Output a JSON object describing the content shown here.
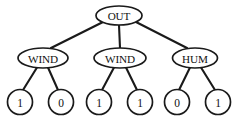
{
  "figure": {
    "kind": "decision-tree-diagram",
    "background_color": "#ffffff",
    "stroke_color": "#1a1a1a",
    "node_fill_color": "#ffffff",
    "width": 239,
    "height": 117
  },
  "tree": {
    "root": {
      "id": "root",
      "label": "OUT",
      "shape": "ellipse",
      "cx": 119,
      "cy": 15.5,
      "rx": 23,
      "ry": 9.5
    },
    "internal": [
      {
        "id": "node-wind-left",
        "label": "WIND",
        "shape": "ellipse",
        "cx": 43,
        "cy": 58,
        "rx": 25,
        "ry": 10
      },
      {
        "id": "node-wind-middle",
        "label": "WIND",
        "shape": "ellipse",
        "cx": 120,
        "cy": 58,
        "rx": 26,
        "ry": 10
      },
      {
        "id": "node-hum-right",
        "label": "HUM",
        "shape": "ellipse",
        "cx": 195,
        "cy": 58,
        "rx": 22.5,
        "ry": 10
      }
    ],
    "leaves": [
      {
        "id": "leaf-1",
        "label": "1",
        "shape": "circle",
        "cx": 20,
        "cy": 102,
        "r": 12.5,
        "parent": "node-wind-left"
      },
      {
        "id": "leaf-2",
        "label": "0",
        "shape": "circle",
        "cx": 61,
        "cy": 102,
        "r": 12.5,
        "parent": "node-wind-left"
      },
      {
        "id": "leaf-3",
        "label": "1",
        "shape": "circle",
        "cx": 99,
        "cy": 102,
        "r": 12.5,
        "parent": "node-wind-middle"
      },
      {
        "id": "leaf-4",
        "label": "1",
        "shape": "circle",
        "cx": 140,
        "cy": 102,
        "r": 12.5,
        "parent": "node-wind-middle"
      },
      {
        "id": "leaf-5",
        "label": "0",
        "shape": "circle",
        "cx": 177,
        "cy": 102,
        "r": 12.5,
        "parent": "node-hum-right"
      },
      {
        "id": "leaf-6",
        "label": "1",
        "shape": "circle",
        "cx": 218,
        "cy": 102,
        "r": 12.5,
        "parent": "node-hum-right"
      }
    ],
    "edges": [
      {
        "id": "edge-root-wind-left",
        "from": "root",
        "to": "node-wind-left",
        "x1": 103,
        "y1": 22,
        "x2": 51,
        "y2": 48
      },
      {
        "id": "edge-root-wind-middle",
        "from": "root",
        "to": "node-wind-middle",
        "x1": 119,
        "y1": 25,
        "x2": 120,
        "y2": 48
      },
      {
        "id": "edge-root-hum-right",
        "from": "root",
        "to": "node-hum-right",
        "x1": 136,
        "y1": 22,
        "x2": 187,
        "y2": 48
      },
      {
        "id": "edge-wind-left-leaf-1",
        "from": "node-wind-left",
        "to": "leaf-1",
        "x1": 37,
        "y1": 67.5,
        "x2": 23,
        "y2": 90
      },
      {
        "id": "edge-wind-left-leaf-2",
        "from": "node-wind-left",
        "to": "leaf-2",
        "x1": 48,
        "y1": 67.5,
        "x2": 58,
        "y2": 90
      },
      {
        "id": "edge-wind-middle-leaf-3",
        "from": "node-wind-middle",
        "to": "leaf-3",
        "x1": 114,
        "y1": 67.5,
        "x2": 102,
        "y2": 90
      },
      {
        "id": "edge-wind-middle-leaf-4",
        "from": "node-wind-middle",
        "to": "leaf-4",
        "x1": 126,
        "y1": 67.5,
        "x2": 137,
        "y2": 90
      },
      {
        "id": "edge-hum-right-leaf-5",
        "from": "node-hum-right",
        "to": "leaf-5",
        "x1": 190,
        "y1": 67.5,
        "x2": 179,
        "y2": 90
      },
      {
        "id": "edge-hum-right-leaf-6",
        "from": "node-hum-right",
        "to": "leaf-6",
        "x1": 201,
        "y1": 67.5,
        "x2": 215,
        "y2": 90
      }
    ]
  }
}
